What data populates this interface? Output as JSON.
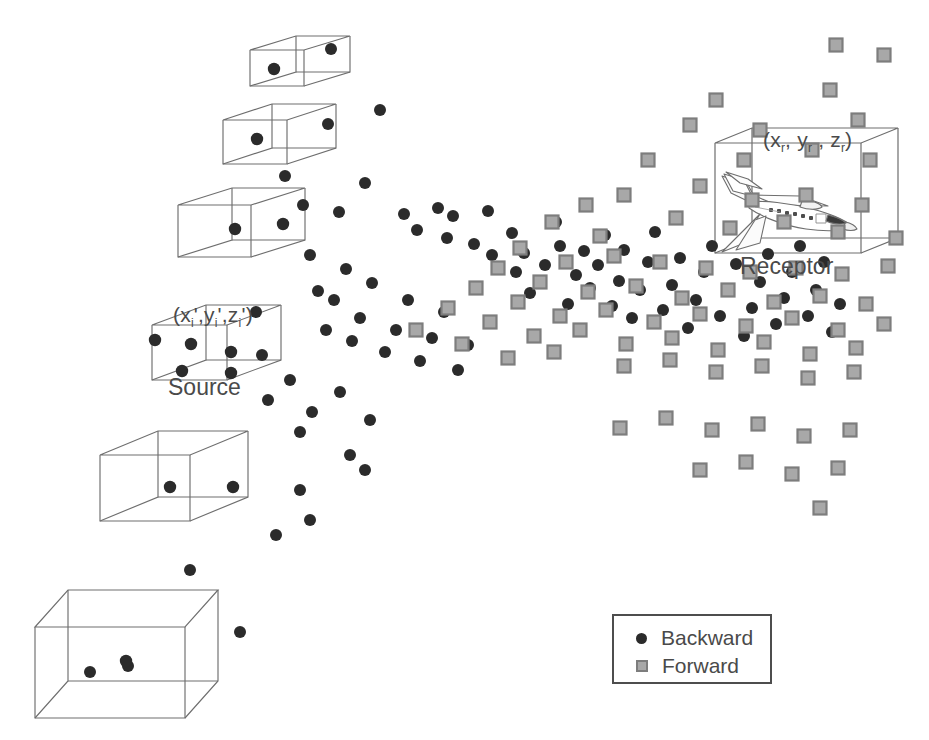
{
  "figure": {
    "type": "scientific-diagram",
    "background_color": "#ffffff",
    "line_color": "#6e6e6e"
  },
  "labels": {
    "source_coords_prefix": "(x",
    "source_title": "Source",
    "receptor_title": "Receptor",
    "source_coords_plain": "(x'i, y'i, z'i)",
    "receptor_coords_plain": "(xr, yr, zr)"
  },
  "source_coord_parts": {
    "open": "(x",
    "sub1": "i",
    "p1": "',y",
    "sub2": "i",
    "p2": "',z",
    "sub3": "i",
    "close": "')"
  },
  "receptor_coord_parts": {
    "open": "(x",
    "sub1": "r",
    "p1": ", y",
    "sub2": "r",
    "p2": " , z",
    "sub3": "r",
    "close": ")"
  },
  "legend": {
    "backward_label": "Backward",
    "forward_label": "Forward",
    "backward_color": "#2b2b2b",
    "backward_marker": "circle",
    "forward_color": "#a8a8a8",
    "forward_border_color": "#7d7d7d",
    "forward_marker": "square",
    "border_color": "#4d4d4d"
  },
  "chart_data": {
    "type": "scatter",
    "title": "",
    "xlabel": "",
    "ylabel": "",
    "xlim": [
      0,
      929
    ],
    "ylim": [
      0,
      740
    ],
    "grid": false,
    "legend_position": "bottom-right",
    "series": [
      {
        "name": "Backward",
        "marker": "circle",
        "color": "#2b2b2b",
        "radius": 6,
        "count": 84,
        "points": [
          [
            331,
            49
          ],
          [
            328,
            124
          ],
          [
            380,
            110
          ],
          [
            285,
            176
          ],
          [
            303,
            205
          ],
          [
            339,
            212
          ],
          [
            365,
            183
          ],
          [
            404,
            214
          ],
          [
            417,
            230
          ],
          [
            438,
            208
          ],
          [
            447,
            238
          ],
          [
            453,
            216
          ],
          [
            474,
            244
          ],
          [
            488,
            211
          ],
          [
            492,
            255
          ],
          [
            512,
            233
          ],
          [
            516,
            272
          ],
          [
            524,
            253
          ],
          [
            530,
            293
          ],
          [
            545,
            265
          ],
          [
            556,
            222
          ],
          [
            560,
            246
          ],
          [
            568,
            304
          ],
          [
            576,
            275
          ],
          [
            584,
            251
          ],
          [
            590,
            288
          ],
          [
            598,
            265
          ],
          [
            605,
            235
          ],
          [
            612,
            306
          ],
          [
            619,
            281
          ],
          [
            624,
            250
          ],
          [
            632,
            318
          ],
          [
            640,
            290
          ],
          [
            648,
            262
          ],
          [
            655,
            232
          ],
          [
            663,
            310
          ],
          [
            672,
            285
          ],
          [
            680,
            258
          ],
          [
            688,
            328
          ],
          [
            696,
            300
          ],
          [
            704,
            272
          ],
          [
            712,
            246
          ],
          [
            720,
            316
          ],
          [
            728,
            290
          ],
          [
            736,
            264
          ],
          [
            744,
            336
          ],
          [
            752,
            308
          ],
          [
            760,
            282
          ],
          [
            768,
            254
          ],
          [
            776,
            324
          ],
          [
            784,
            298
          ],
          [
            792,
            272
          ],
          [
            800,
            246
          ],
          [
            808,
            316
          ],
          [
            816,
            290
          ],
          [
            824,
            262
          ],
          [
            832,
            332
          ],
          [
            840,
            304
          ],
          [
            310,
            255
          ],
          [
            318,
            291
          ],
          [
            326,
            330
          ],
          [
            334,
            300
          ],
          [
            346,
            269
          ],
          [
            352,
            341
          ],
          [
            360,
            318
          ],
          [
            372,
            283
          ],
          [
            385,
            352
          ],
          [
            396,
            330
          ],
          [
            408,
            300
          ],
          [
            420,
            361
          ],
          [
            432,
            338
          ],
          [
            444,
            312
          ],
          [
            458,
            370
          ],
          [
            468,
            345
          ],
          [
            256,
            312
          ],
          [
            262,
            355
          ],
          [
            268,
            400
          ],
          [
            290,
            380
          ],
          [
            300,
            432
          ],
          [
            312,
            412
          ],
          [
            340,
            392
          ],
          [
            350,
            455
          ],
          [
            365,
            470
          ],
          [
            370,
            420
          ],
          [
            300,
            490
          ],
          [
            310,
            520
          ],
          [
            276,
            535
          ],
          [
            190,
            570
          ],
          [
            240,
            632
          ],
          [
            128,
            666
          ],
          [
            90,
            672
          ]
        ]
      },
      {
        "name": "Forward",
        "marker": "square",
        "color": "#a8a8a8",
        "border_color": "#7d7d7d",
        "size": 13,
        "count": 78,
        "points": [
          [
            836,
            45
          ],
          [
            884,
            55
          ],
          [
            830,
            90
          ],
          [
            716,
            100
          ],
          [
            760,
            130
          ],
          [
            858,
            120
          ],
          [
            690,
            125
          ],
          [
            744,
            160
          ],
          [
            812,
            150
          ],
          [
            870,
            160
          ],
          [
            648,
            160
          ],
          [
            700,
            186
          ],
          [
            752,
            200
          ],
          [
            806,
            195
          ],
          [
            862,
            205
          ],
          [
            624,
            195
          ],
          [
            676,
            218
          ],
          [
            730,
            228
          ],
          [
            784,
            222
          ],
          [
            838,
            232
          ],
          [
            896,
            238
          ],
          [
            586,
            205
          ],
          [
            552,
            222
          ],
          [
            600,
            236
          ],
          [
            520,
            248
          ],
          [
            566,
            262
          ],
          [
            614,
            256
          ],
          [
            660,
            262
          ],
          [
            706,
            268
          ],
          [
            750,
            272
          ],
          [
            796,
            268
          ],
          [
            842,
            274
          ],
          [
            888,
            266
          ],
          [
            498,
            268
          ],
          [
            540,
            282
          ],
          [
            588,
            292
          ],
          [
            636,
            286
          ],
          [
            682,
            298
          ],
          [
            728,
            290
          ],
          [
            774,
            302
          ],
          [
            820,
            296
          ],
          [
            866,
            304
          ],
          [
            476,
            288
          ],
          [
            518,
            302
          ],
          [
            560,
            316
          ],
          [
            606,
            310
          ],
          [
            654,
            322
          ],
          [
            700,
            314
          ],
          [
            746,
            326
          ],
          [
            792,
            318
          ],
          [
            838,
            330
          ],
          [
            884,
            324
          ],
          [
            448,
            308
          ],
          [
            490,
            322
          ],
          [
            534,
            336
          ],
          [
            580,
            330
          ],
          [
            626,
            344
          ],
          [
            672,
            338
          ],
          [
            718,
            350
          ],
          [
            764,
            342
          ],
          [
            810,
            354
          ],
          [
            856,
            348
          ],
          [
            416,
            330
          ],
          [
            462,
            344
          ],
          [
            508,
            358
          ],
          [
            554,
            352
          ],
          [
            624,
            366
          ],
          [
            670,
            360
          ],
          [
            716,
            372
          ],
          [
            762,
            366
          ],
          [
            808,
            378
          ],
          [
            854,
            372
          ],
          [
            620,
            428
          ],
          [
            666,
            418
          ],
          [
            712,
            430
          ],
          [
            758,
            424
          ],
          [
            804,
            436
          ],
          [
            850,
            430
          ],
          [
            700,
            470
          ],
          [
            746,
            462
          ],
          [
            792,
            474
          ],
          [
            838,
            468
          ],
          [
            820,
            508
          ]
        ]
      }
    ]
  },
  "boxes": [
    {
      "name": "source-box-1",
      "size": "smallest",
      "has_label": false,
      "particles": 1
    },
    {
      "name": "source-box-2",
      "size": "small",
      "has_label": false,
      "particles": 1
    },
    {
      "name": "source-box-3",
      "size": "medium",
      "has_label": false,
      "particles": 1
    },
    {
      "name": "source-box-4",
      "size": "labeled",
      "has_label": true,
      "particles": 5
    },
    {
      "name": "source-box-5",
      "size": "large",
      "has_label": false,
      "particles": 1
    },
    {
      "name": "source-box-6",
      "size": "largest",
      "has_label": false,
      "particles": 1
    },
    {
      "name": "receptor-box",
      "size": "receptor",
      "has_label": true,
      "particles": 0
    }
  ]
}
